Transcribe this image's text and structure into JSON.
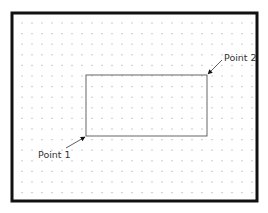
{
  "diagram": {
    "frame": {
      "x": 12,
      "y": 13,
      "width": 245,
      "height": 188,
      "stroke": "#111111",
      "stroke_width": 3
    },
    "grid": {
      "x0": 22,
      "y0": 23,
      "dx": 10,
      "dy": 10.6,
      "cols": 24,
      "rows": 17,
      "color": "#b8b8b8"
    },
    "rectangle": {
      "x1": 86,
      "y1": 136,
      "x2": 207,
      "y2": 75,
      "stroke": "#555555"
    },
    "points": [
      {
        "label": "Point 1",
        "label_x": 38,
        "label_y": 150,
        "arrow_from": [
          66,
          148
        ],
        "arrow_to": [
          85,
          137
        ]
      },
      {
        "label": "Point 2",
        "label_x": 224,
        "label_y": 53,
        "arrow_from": [
          222,
          60
        ],
        "arrow_to": [
          208,
          74
        ]
      }
    ]
  }
}
